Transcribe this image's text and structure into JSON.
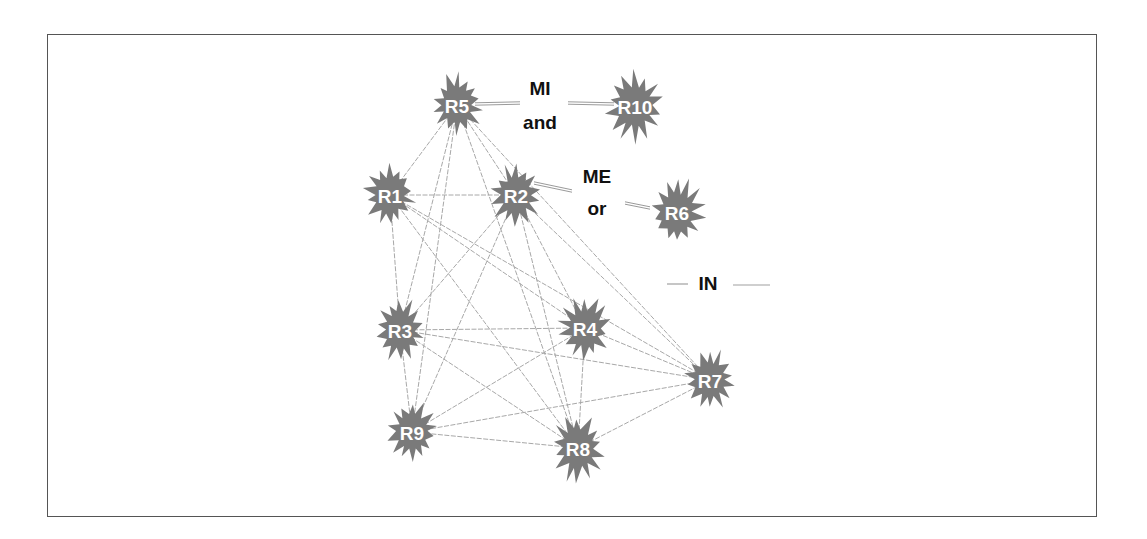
{
  "diagram": {
    "type": "network-graph",
    "colors": {
      "node_fill": "#7a7a7a",
      "node_text": "#ffffff",
      "edge": "#a8a8a8",
      "label_text": "#111111",
      "frame": "#555555"
    },
    "nodes": [
      {
        "id": "R5",
        "label": "R5",
        "x": 457,
        "y": 105,
        "r": 30
      },
      {
        "id": "R10",
        "label": "R10",
        "x": 635,
        "y": 106,
        "r": 34
      },
      {
        "id": "R1",
        "label": "R1",
        "x": 390,
        "y": 195,
        "r": 30
      },
      {
        "id": "R2",
        "label": "R2",
        "x": 516,
        "y": 195,
        "r": 30
      },
      {
        "id": "R6",
        "label": "R6",
        "x": 677,
        "y": 212,
        "r": 32
      },
      {
        "id": "R3",
        "label": "R3",
        "x": 400,
        "y": 330,
        "r": 30
      },
      {
        "id": "R4",
        "label": "R4",
        "x": 585,
        "y": 328,
        "r": 30
      },
      {
        "id": "R7",
        "label": "R7",
        "x": 710,
        "y": 380,
        "r": 30
      },
      {
        "id": "R9",
        "label": "R9",
        "x": 412,
        "y": 432,
        "r": 30
      },
      {
        "id": "R8",
        "label": "R8",
        "x": 578,
        "y": 448,
        "r": 32
      }
    ],
    "edges": [
      [
        "R5",
        "R1"
      ],
      [
        "R5",
        "R2"
      ],
      [
        "R5",
        "R3"
      ],
      [
        "R5",
        "R9"
      ],
      [
        "R5",
        "R8"
      ],
      [
        "R5",
        "R7"
      ],
      [
        "R1",
        "R2"
      ],
      [
        "R1",
        "R3"
      ],
      [
        "R1",
        "R4"
      ],
      [
        "R1",
        "R7"
      ],
      [
        "R1",
        "R8"
      ],
      [
        "R2",
        "R3"
      ],
      [
        "R2",
        "R9"
      ],
      [
        "R2",
        "R8"
      ],
      [
        "R2",
        "R4"
      ],
      [
        "R2",
        "R7"
      ],
      [
        "R3",
        "R4"
      ],
      [
        "R3",
        "R7"
      ],
      [
        "R3",
        "R9"
      ],
      [
        "R3",
        "R8"
      ],
      [
        "R4",
        "R9"
      ],
      [
        "R4",
        "R8"
      ],
      [
        "R4",
        "R7"
      ],
      [
        "R9",
        "R7"
      ],
      [
        "R9",
        "R8"
      ],
      [
        "R8",
        "R7"
      ]
    ],
    "special_edges": [
      {
        "from": "R5",
        "to": "R10",
        "relation": "MI"
      },
      {
        "from": "R2",
        "to": "R6",
        "relation": "ME"
      }
    ],
    "legend": {
      "mi_line1": "MI",
      "mi_line2": "and",
      "me_line1": "ME",
      "me_line2": "or",
      "in_label": "IN"
    }
  }
}
